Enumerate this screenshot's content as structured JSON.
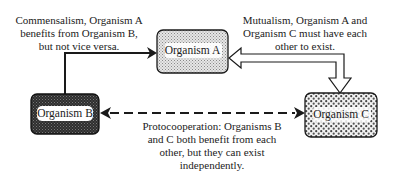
{
  "nodes": {
    "a": {
      "label": "Organism A",
      "fill": "#d8d8d8"
    },
    "b": {
      "label": "Organism B",
      "fill": "#3a3a3a"
    },
    "c": {
      "label": "Organism C",
      "fill": "#bdbdbd"
    }
  },
  "captions": {
    "commensalism": [
      "Commensalism, Organism A",
      "benefits from Organism B,",
      "but not vice versa."
    ],
    "mutualism": [
      "Mutualism, Organism A and",
      "Organism C must have each",
      "other to exist."
    ],
    "protocooperation": [
      "Protocooperation:  Organisms B",
      "and C both benefit from each",
      "other, but they can exist",
      "independently."
    ]
  },
  "relationships": [
    {
      "type": "commensalism",
      "from": "Organism B",
      "to": "Organism A",
      "style": "solid-arrow"
    },
    {
      "type": "mutualism",
      "from": "Organism A",
      "to": "Organism C",
      "style": "hollow-double-arrow"
    },
    {
      "type": "protocooperation",
      "between": [
        "Organism B",
        "Organism C"
      ],
      "style": "dashed-bidirectional-arrow"
    }
  ]
}
